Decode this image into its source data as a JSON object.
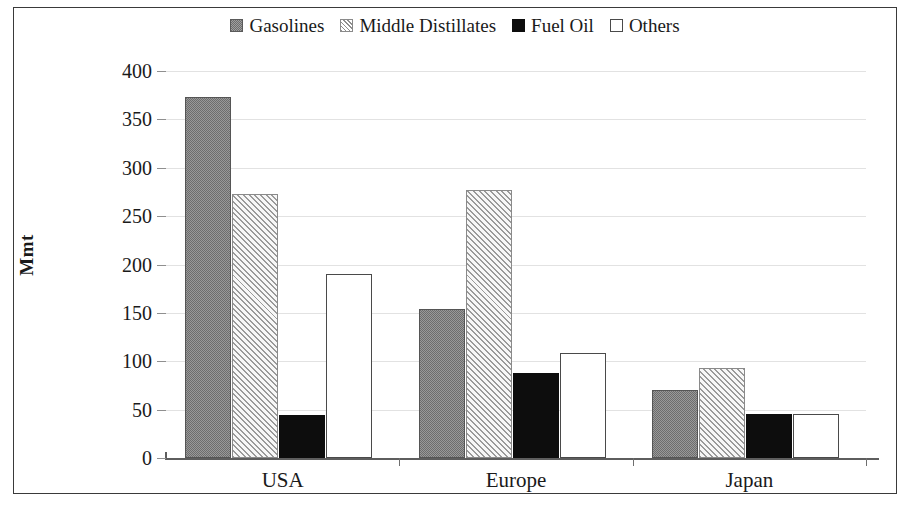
{
  "chart_data": {
    "type": "bar",
    "title": "",
    "xlabel": "",
    "ylabel": "Mmt",
    "ylim": [
      0,
      400
    ],
    "yticks": [
      0,
      50,
      100,
      150,
      200,
      250,
      300,
      350,
      400
    ],
    "grid": true,
    "legend_position": "top-center",
    "categories": [
      "USA",
      "Europe",
      "Japan"
    ],
    "series": [
      {
        "name": "Gasolines",
        "key": "gasolines",
        "values": [
          373,
          154,
          70
        ],
        "swatch": "sw-gasolines",
        "color": "#6d6d6d"
      },
      {
        "name": "Middle Distillates",
        "key": "middle_distillates",
        "values": [
          273,
          277,
          93
        ],
        "swatch": "sw-middle",
        "color": "#9a9a9a"
      },
      {
        "name": "Fuel Oil",
        "key": "fuel_oil",
        "values": [
          44,
          88,
          45
        ],
        "swatch": "sw-fueloil",
        "color": "#0d0d0d"
      },
      {
        "name": "Others",
        "key": "others",
        "values": [
          190,
          109,
          45
        ],
        "swatch": "sw-others",
        "color": "#ffffff"
      }
    ]
  },
  "colors": {
    "frame_border": "#3a3a3a",
    "gridline": "#e2e2e2",
    "axis": "#5e5e5e",
    "background": "#ffffff",
    "text": "#1a1a1a"
  }
}
